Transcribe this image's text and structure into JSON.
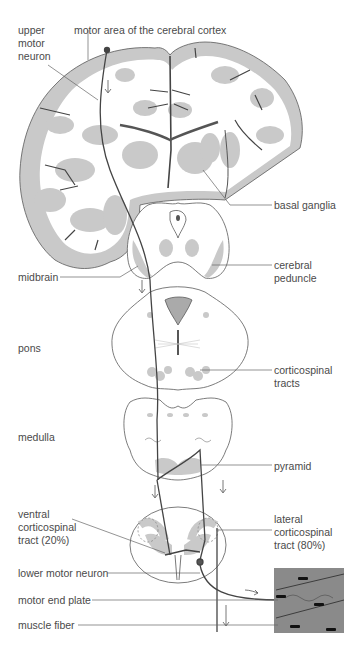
{
  "diagram": {
    "colors": {
      "outline": "#5a5a5a",
      "gray_matter": "#c9c9c9",
      "neuron_path": "#4a4a4a",
      "muscle": "#8a8a8a",
      "text": "#4a4a4a"
    },
    "labels": {
      "upper_motor_neuron": "upper\nmotor\nneuron",
      "motor_area": "motor area of the cerebral cortex",
      "basal_ganglia": "basal ganglia",
      "midbrain": "midbrain",
      "cerebral_peduncle": "cerebral\npeduncle",
      "pons": "pons",
      "corticospinal_tracts": "corticospinal\ntracts",
      "medulla": "medulla",
      "pyramid": "pyramid",
      "ventral_tract": "ventral\ncorticospinal\ntract (20%)",
      "lateral_tract": "lateral\ncorticospinal\ntract (80%)",
      "lower_motor_neuron": "lower motor neuron",
      "motor_end_plate": "motor end plate",
      "muscle_fiber": "muscle fiber"
    },
    "structures": [
      "cerebrum (coronal section)",
      "midbrain",
      "pons",
      "medulla",
      "spinal cord",
      "muscle fiber"
    ]
  }
}
